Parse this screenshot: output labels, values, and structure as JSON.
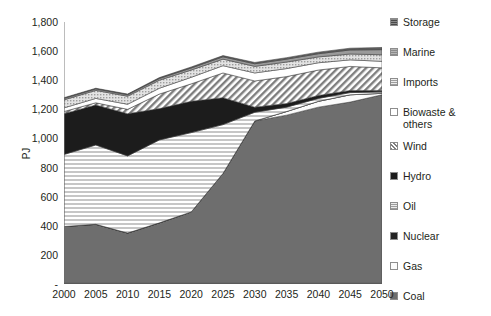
{
  "chart_data": {
    "type": "area",
    "stacked": true,
    "title": "",
    "xlabel": "",
    "ylabel": "PJ",
    "grid": false,
    "legend_position": "right",
    "x": [
      2000,
      2005,
      2010,
      2015,
      2020,
      2025,
      2030,
      2035,
      2040,
      2045,
      2050
    ],
    "xticklabels": [
      "2000",
      "2005",
      "2010",
      "2015",
      "2020",
      "2025",
      "2030",
      "2035",
      "2040",
      "2045",
      "2050"
    ],
    "ylim": [
      0,
      1800
    ],
    "yticks": [
      0,
      200,
      400,
      600,
      800,
      1000,
      1200,
      1400,
      1600,
      1800
    ],
    "yticklabels": [
      "-",
      "200",
      "400",
      "600",
      "800",
      "1,000",
      "1,200",
      "1,400",
      "1,600",
      "1,800"
    ],
    "series": [
      {
        "name": "Coal",
        "color": "#6e6e6e",
        "pattern": "solid",
        "values": [
          395,
          410,
          350,
          420,
          495,
          760,
          1120,
          1160,
          1215,
          1250,
          1300
        ]
      },
      {
        "name": "Gas",
        "color": "#fbfbfb",
        "pattern": "solid-light",
        "values": [
          0,
          0,
          0,
          0,
          0,
          0,
          0,
          25,
          40,
          50,
          10
        ]
      },
      {
        "name": "Nuclear",
        "color": "#232323",
        "pattern": "solid-dark",
        "values": [
          0,
          0,
          0,
          0,
          0,
          0,
          0,
          0,
          0,
          0,
          0
        ]
      },
      {
        "name": "Oil",
        "color": "#e8e8e8",
        "pattern": "h-lines",
        "values": [
          495,
          545,
          530,
          570,
          545,
          335,
          60,
          30,
          20,
          15,
          10
        ]
      },
      {
        "name": "Hydro",
        "color": "#1c1c1c",
        "pattern": "solid-dark",
        "values": [
          280,
          275,
          290,
          215,
          215,
          185,
          35,
          25,
          20,
          15,
          10
        ]
      },
      {
        "name": "Wind",
        "color": "#ffffff",
        "pattern": "diag-hatch",
        "values": [
          15,
          15,
          30,
          100,
          120,
          170,
          180,
          185,
          175,
          165,
          155
        ]
      },
      {
        "name": "Biowaste & others",
        "color": "#ffffff",
        "pattern": "solid-white",
        "values": [
          25,
          30,
          35,
          40,
          45,
          50,
          55,
          55,
          50,
          45,
          45
        ]
      },
      {
        "name": "Imports",
        "color": "#d4d4d4",
        "pattern": "dots",
        "values": [
          55,
          55,
          55,
          55,
          50,
          45,
          45,
          45,
          40,
          40,
          45
        ]
      },
      {
        "name": "Marine",
        "color": "#9a9a9a",
        "pattern": "solid-mid",
        "values": [
          10,
          10,
          10,
          12,
          14,
          16,
          18,
          20,
          22,
          28,
          35
        ]
      },
      {
        "name": "Storage",
        "color": "#5f5f5f",
        "pattern": "solid-grey",
        "values": [
          5,
          5,
          5,
          6,
          7,
          8,
          9,
          10,
          11,
          12,
          15
        ]
      }
    ],
    "totals": [
      1280,
      1345,
      1305,
      1418,
      1491,
      1569,
      1522,
      1555,
      1593,
      1620,
      1625
    ]
  },
  "legend": {
    "items": [
      {
        "label": "Storage"
      },
      {
        "label": "Marine"
      },
      {
        "label": "Imports"
      },
      {
        "label": "Biowaste &\nothers"
      },
      {
        "label": "Wind"
      },
      {
        "label": "Hydro"
      },
      {
        "label": "Oil"
      },
      {
        "label": "Nuclear"
      },
      {
        "label": "Gas"
      },
      {
        "label": "Coal"
      }
    ]
  }
}
